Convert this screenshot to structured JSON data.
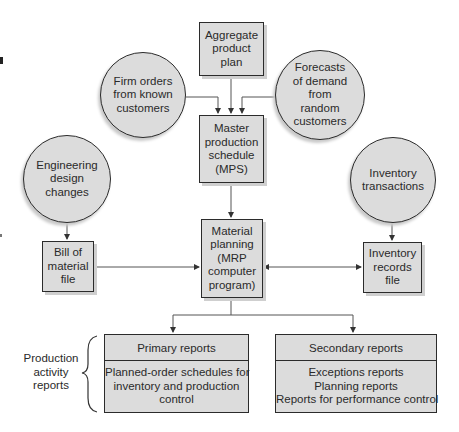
{
  "diagram": {
    "type": "flowchart",
    "nodes": {
      "aggregate_plan": {
        "label": "Aggregate\nproduct\nplan",
        "shape": "box"
      },
      "firm_orders": {
        "label": "Firm orders\nfrom known\ncustomers",
        "shape": "circle"
      },
      "forecasts": {
        "label": "Forecasts\nof demand\nfrom\nrandom\ncustomers",
        "shape": "circle"
      },
      "mps": {
        "label": "Master\nproduction\nschedule\n(MPS)",
        "shape": "box"
      },
      "engineering_changes": {
        "label": "Engineering\ndesign\nchanges",
        "shape": "circle"
      },
      "inventory_transactions": {
        "label": "Inventory\ntransactions",
        "shape": "circle"
      },
      "bom": {
        "label": "Bill of\nmaterial\nfile",
        "shape": "box"
      },
      "mrp": {
        "label": "Material\nplanning\n(MRP\ncomputer\nprogram)",
        "shape": "box"
      },
      "inventory_records": {
        "label": "Inventory\nrecords\nfile",
        "shape": "box"
      }
    },
    "reports": {
      "primary": {
        "title": "Primary reports",
        "items": [
          "Planned-order schedules for",
          "inventory and production",
          "control"
        ]
      },
      "secondary": {
        "title": "Secondary reports",
        "items": [
          "Exceptions reports",
          "Planning reports",
          "Reports for performance control"
        ]
      }
    },
    "group_label": "Production\nactivity\nreports",
    "edges": [
      {
        "from": "aggregate_plan",
        "to": "mps"
      },
      {
        "from": "firm_orders",
        "to": "mps"
      },
      {
        "from": "forecasts",
        "to": "mps"
      },
      {
        "from": "mps",
        "to": "mrp"
      },
      {
        "from": "engineering_changes",
        "to": "bom"
      },
      {
        "from": "bom",
        "to": "mrp"
      },
      {
        "from": "inventory_transactions",
        "to": "inventory_records"
      },
      {
        "from": "inventory_records",
        "to": "mrp",
        "bidirectional": true
      },
      {
        "from": "mrp",
        "to": "primary_reports"
      },
      {
        "from": "mrp",
        "to": "secondary_reports"
      }
    ],
    "colors": {
      "fill": "#dcdcdc",
      "stroke": "#2b2b2b",
      "line": "#555555"
    }
  }
}
